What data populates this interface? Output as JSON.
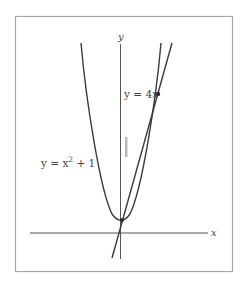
{
  "figure": {
    "colors": {
      "frame": "#a8a8a8",
      "axis": "#555555",
      "curve": "#3a3a3a",
      "text": "#444444",
      "marker": "#b8b8b8"
    },
    "axes": {
      "x_label": "x",
      "y_label": "y"
    },
    "curves": [
      {
        "name": "parabola",
        "equation_label": "y = x² + 1",
        "label_base": "y = x",
        "label_sup": "2",
        "label_tail": " + 1"
      },
      {
        "name": "line",
        "equation_label": "y = 4x",
        "label_base": "y = 4",
        "label_var": "x"
      }
    ],
    "points": [
      {
        "name": "upper-intersection"
      },
      {
        "name": "lower-intersection"
      }
    ]
  }
}
